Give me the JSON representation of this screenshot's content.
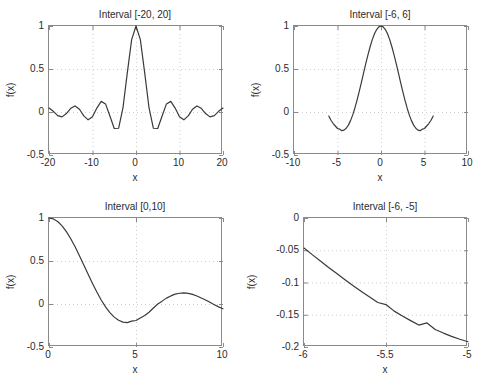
{
  "figure": {
    "width": 488,
    "height": 384,
    "background": "#ffffff",
    "axis_color": "#8a8a8a",
    "grid_color": "#cfcfcf",
    "line_color": "#3a3a3a",
    "text_color": "#2b2b2b"
  },
  "chart_data": [
    {
      "id": "subplot-1",
      "type": "line",
      "title": "Interval [-20, 20]",
      "xlabel": "x",
      "ylabel": "f(x)",
      "xlim": [
        -20,
        20
      ],
      "ylim": [
        -0.5,
        1
      ],
      "xticks": [
        -20,
        -10,
        0,
        10,
        20
      ],
      "xticklabels": [
        "-20",
        "-10",
        "0",
        "10",
        "20"
      ],
      "yticks": [
        -0.5,
        0,
        0.5,
        1
      ],
      "yticklabels": [
        "-0.5",
        "0",
        "0.5",
        "1"
      ],
      "grid": true,
      "legend": null,
      "series": [
        {
          "name": "sin(x)/x",
          "x": [
            -20,
            -19,
            -18,
            -17,
            -16,
            -15,
            -14,
            -13,
            -12,
            -11,
            -10,
            -9,
            -8,
            -7,
            -6,
            -5,
            -4,
            -3,
            -2,
            -1,
            0,
            1,
            2,
            3,
            4,
            5,
            6,
            7,
            8,
            9,
            10,
            11,
            12,
            13,
            14,
            15,
            16,
            17,
            18,
            19,
            20
          ],
          "y": [
            0.0456,
            0.0079,
            -0.0417,
            -0.0565,
            -0.018,
            0.0434,
            0.0708,
            0.0323,
            -0.0447,
            -0.0909,
            -0.0544,
            0.0458,
            0.1237,
            0.0939,
            -0.0466,
            -0.1918,
            -0.1892,
            0.047,
            0.4546,
            0.8415,
            1.0,
            0.8415,
            0.4546,
            0.047,
            -0.1892,
            -0.1918,
            -0.0466,
            0.0939,
            0.1237,
            0.0458,
            -0.0544,
            -0.0909,
            -0.0447,
            0.0323,
            0.0708,
            0.0434,
            -0.018,
            -0.0565,
            -0.0417,
            0.0079,
            0.0456
          ]
        }
      ]
    },
    {
      "id": "subplot-2",
      "type": "line",
      "title": "Interval [-6, 6]",
      "xlabel": "x",
      "ylabel": "f(x)",
      "xlim": [
        -10,
        10
      ],
      "ylim": [
        -0.5,
        1
      ],
      "xticks": [
        -10,
        -5,
        0,
        5,
        10
      ],
      "xticklabels": [
        "-10",
        "-5",
        "0",
        "5",
        "10"
      ],
      "yticks": [
        -0.5,
        0,
        0.5,
        1
      ],
      "yticklabels": [
        "-0.5",
        "0",
        "0.5",
        "1"
      ],
      "grid": true,
      "legend": null,
      "series": [
        {
          "name": "sin(x)/x",
          "x": [
            -6,
            -5.75,
            -5.5,
            -5.25,
            -5,
            -4.75,
            -4.5,
            -4.25,
            -4,
            -3.75,
            -3.5,
            -3.25,
            -3,
            -2.75,
            -2.5,
            -2.25,
            -2,
            -1.75,
            -1.5,
            -1.25,
            -1,
            -0.75,
            -0.5,
            -0.25,
            0,
            0.25,
            0.5,
            0.75,
            1,
            1.25,
            1.5,
            1.75,
            2,
            2.25,
            2.5,
            2.75,
            3,
            3.25,
            3.5,
            3.75,
            4,
            4.25,
            4.5,
            4.75,
            5,
            5.25,
            5.5,
            5.75,
            6
          ],
          "y": [
            -0.0466,
            -0.0957,
            -0.1342,
            -0.1627,
            -0.1918,
            -0.1994,
            -0.2172,
            -0.2105,
            -0.1892,
            -0.1527,
            -0.1002,
            -0.0335,
            0.047,
            0.1391,
            0.2394,
            0.3455,
            0.4546,
            0.5615,
            0.665,
            0.7589,
            0.8415,
            0.9089,
            0.9589,
            0.9896,
            1.0,
            0.9896,
            0.9589,
            0.9089,
            0.8415,
            0.7589,
            0.665,
            0.5615,
            0.4546,
            0.3455,
            0.2394,
            0.1391,
            0.047,
            -0.0335,
            -0.1002,
            -0.1527,
            -0.1892,
            -0.2105,
            -0.2172,
            -0.1994,
            -0.1918,
            -0.1627,
            -0.1342,
            -0.0957,
            -0.0466
          ]
        }
      ]
    },
    {
      "id": "subplot-3",
      "type": "line",
      "title": "Interval [0,10]",
      "xlabel": "x",
      "ylabel": "f(x)",
      "xlim": [
        0,
        10
      ],
      "ylim": [
        -0.5,
        1
      ],
      "xticks": [
        0,
        5,
        10
      ],
      "xticklabels": [
        "0",
        "5",
        "10"
      ],
      "yticks": [
        -0.5,
        0,
        0.5,
        1
      ],
      "yticklabels": [
        "-0.5",
        "0",
        "0.5",
        "1"
      ],
      "grid": true,
      "legend": null,
      "series": [
        {
          "name": "sin(x)/x",
          "x": [
            0,
            0.25,
            0.5,
            0.75,
            1,
            1.25,
            1.5,
            1.75,
            2,
            2.25,
            2.5,
            2.75,
            3,
            3.25,
            3.5,
            3.75,
            4,
            4.25,
            4.5,
            4.75,
            5,
            5.25,
            5.5,
            5.75,
            6,
            6.25,
            6.5,
            6.75,
            7,
            7.25,
            7.5,
            7.75,
            8,
            8.25,
            8.5,
            8.75,
            9,
            9.25,
            9.5,
            9.75,
            10
          ],
          "y": [
            1.0,
            0.9896,
            0.9589,
            0.9089,
            0.8415,
            0.7589,
            0.665,
            0.5615,
            0.4546,
            0.3455,
            0.2394,
            0.1391,
            0.047,
            -0.0335,
            -0.1002,
            -0.1527,
            -0.1892,
            -0.2105,
            -0.2172,
            -0.1994,
            -0.1918,
            -0.1627,
            -0.1342,
            -0.0957,
            -0.0466,
            0.0005,
            0.0334,
            0.0682,
            0.0939,
            0.1142,
            0.1252,
            0.1287,
            0.1237,
            0.1113,
            0.0927,
            0.0697,
            0.0458,
            0.0193,
            -0.0077,
            -0.0334,
            -0.0544
          ]
        }
      ]
    },
    {
      "id": "subplot-4",
      "type": "line",
      "title": "Interval [-6, -5]",
      "xlabel": "x",
      "ylabel": "f(x)",
      "xlim": [
        -6,
        -5
      ],
      "ylim": [
        -0.2,
        0
      ],
      "xticks": [
        -6,
        -5.5,
        -5
      ],
      "xticklabels": [
        "-6",
        "-5.5",
        "-5"
      ],
      "yticks": [
        -0.2,
        -0.15,
        -0.1,
        -0.05,
        0
      ],
      "yticklabels": [
        "-0.2",
        "-0.15",
        "-0.1",
        "-0.05",
        "0"
      ],
      "grid": true,
      "legend": null,
      "series": [
        {
          "name": "sin(x)/x",
          "x": [
            -6,
            -5.95,
            -5.9,
            -5.85,
            -5.8,
            -5.75,
            -5.7,
            -5.65,
            -5.6,
            -5.55,
            -5.5,
            -5.45,
            -5.4,
            -5.35,
            -5.3,
            -5.25,
            -5.2,
            -5.15,
            -5.1,
            -5.05,
            -5
          ],
          "y": [
            -0.0466,
            -0.0568,
            -0.0668,
            -0.0766,
            -0.0862,
            -0.0957,
            -0.1049,
            -0.1138,
            -0.1225,
            -0.131,
            -0.1342,
            -0.1444,
            -0.1519,
            -0.1591,
            -0.166,
            -0.1627,
            -0.1728,
            -0.1784,
            -0.1836,
            -0.1879,
            -0.1918
          ]
        }
      ]
    }
  ]
}
